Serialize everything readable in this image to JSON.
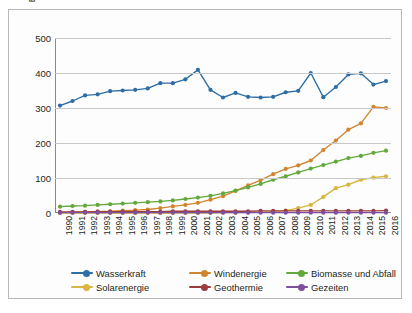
{
  "figure": {
    "ylabel_line1": "Bruttostromerzeugung – EU-28",
    "ylabel_line2": "Erneuerbare Energien – 1990–2016 (in TWh)"
  },
  "legend": {
    "position": "bottom",
    "items": [
      {
        "label": "Wasserkraft",
        "color": "#2e6da4"
      },
      {
        "label": "Windenergie",
        "color": "#d1852f"
      },
      {
        "label": "Biomasse und Abfall",
        "color": "#63a83c"
      },
      {
        "label": "Solarenergie",
        "color": "#d8b63f"
      },
      {
        "label": "Geothermie",
        "color": "#9e3b3b"
      },
      {
        "label": "Gezeiten",
        "color": "#7d4f9e"
      }
    ]
  },
  "chart_data": {
    "type": "line",
    "title": "",
    "xlabel": "",
    "ylabel": "Bruttostromerzeugung – EU-28 Erneuerbare Energien – 1990–2016 (in TWh)",
    "ylim": [
      0,
      500
    ],
    "yticks": [
      0,
      100,
      200,
      300,
      400,
      500
    ],
    "grid": true,
    "x": [
      1990,
      1991,
      1992,
      1993,
      1994,
      1995,
      1996,
      1997,
      1998,
      1999,
      2000,
      2001,
      2002,
      2003,
      2004,
      2005,
      2006,
      2007,
      2008,
      2009,
      2010,
      2011,
      2012,
      2013,
      2014,
      2015,
      2016
    ],
    "categories": [
      "1990",
      "1991",
      "1992",
      "1993",
      "1994",
      "1995",
      "1996",
      "1997",
      "1998",
      "1999",
      "2000",
      "2001",
      "2002",
      "2003",
      "2004",
      "2005",
      "2006",
      "2007",
      "2008",
      "2009",
      "2010",
      "2011",
      "2012",
      "2013",
      "2014",
      "2015",
      "2016"
    ],
    "series": [
      {
        "name": "Wasserkraft",
        "color": "#2e6da4",
        "values": [
          307,
          320,
          336,
          339,
          348,
          350,
          352,
          356,
          371,
          371,
          382,
          409,
          352,
          330,
          343,
          332,
          330,
          332,
          345,
          349,
          400,
          331,
          360,
          396,
          399,
          367,
          377
        ]
      },
      {
        "name": "Windenergie",
        "color": "#d1852f",
        "values": [
          1,
          2,
          3,
          4,
          5,
          7,
          8,
          10,
          14,
          19,
          23,
          29,
          38,
          48,
          63,
          79,
          94,
          111,
          126,
          136,
          150,
          180,
          207,
          238,
          256,
          303,
          300
        ]
      },
      {
        "name": "Biomasse und Abfall",
        "color": "#63a83c",
        "values": [
          18,
          20,
          21,
          23,
          25,
          27,
          29,
          31,
          33,
          36,
          40,
          44,
          49,
          56,
          64,
          73,
          83,
          95,
          105,
          116,
          127,
          137,
          147,
          157,
          163,
          172,
          178
        ]
      },
      {
        "name": "Solarenergie",
        "color": "#d8b63f",
        "values": [
          0,
          0,
          0,
          0,
          0,
          0,
          0,
          0,
          0,
          0,
          0,
          0,
          0,
          1,
          1,
          2,
          3,
          4,
          7,
          14,
          23,
          46,
          71,
          81,
          95,
          101,
          105
        ]
      },
      {
        "name": "Geothermie",
        "color": "#9e3b3b",
        "values": [
          3,
          3,
          3,
          4,
          4,
          4,
          4,
          4,
          4,
          5,
          5,
          5,
          5,
          5,
          5,
          5,
          6,
          6,
          6,
          6,
          6,
          6,
          6,
          6,
          6,
          6,
          7
        ]
      },
      {
        "name": "Gezeiten",
        "color": "#7d4f9e",
        "values": [
          1,
          1,
          1,
          1,
          1,
          1,
          1,
          1,
          1,
          1,
          1,
          1,
          1,
          1,
          1,
          1,
          1,
          1,
          1,
          1,
          1,
          1,
          1,
          1,
          1,
          1,
          1
        ]
      }
    ]
  }
}
